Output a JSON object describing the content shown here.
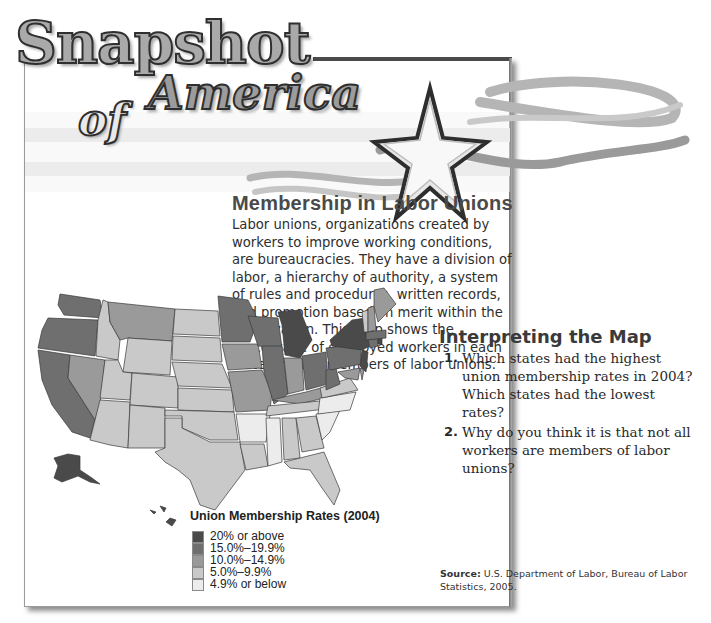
{
  "banner": {
    "title_line1": "Snapshot",
    "title_of": "of",
    "title_line2": "America",
    "decoration": "star-icon"
  },
  "article": {
    "heading": "Membership in Labor Unions",
    "intro": "Labor unions, organizations created by workers to improve working conditions, are bureaucracies. They have a division of labor, a hierarchy of authority, a system of rules and procedures, written records, and promotion based on merit within the organization. This map shows the percentage of employed workers in each state who are members of labor unions."
  },
  "interpreting": {
    "title": "Interpreting the Map",
    "questions": [
      {
        "num": "1.",
        "text": "Which states had the highest union membership rates in 2004? Which states had the lowest rates?"
      },
      {
        "num": "2.",
        "text": "Why do you think it is that not all workers are members of labor unions?"
      }
    ]
  },
  "legend": {
    "title": "Union Membership Rates (2004)",
    "items": [
      {
        "label": "20% or above",
        "color": "#4a4a4a"
      },
      {
        "label": "15.0%–19.9%",
        "color": "#6f6f6f"
      },
      {
        "label": "10.0%–14.9%",
        "color": "#9a9a9a"
      },
      {
        "label": "5.0%–9.9%",
        "color": "#c9c9c9"
      },
      {
        "label": "4.9% or below",
        "color": "#ececec"
      }
    ]
  },
  "source": {
    "label": "Source:",
    "text": "U.S. Department of Labor, Bureau of Labor Statistics, 2005."
  },
  "map": {
    "states": {
      "WA": 1,
      "OR": 1,
      "CA": 1,
      "NV": 2,
      "ID": 3,
      "MT": 2,
      "WY": 3,
      "UT": 3,
      "AZ": 3,
      "CO": 3,
      "NM": 3,
      "ND": 3,
      "SD": 3,
      "NE": 3,
      "KS": 3,
      "OK": 3,
      "TX": 3,
      "MN": 1,
      "IA": 2,
      "MO": 2,
      "AR": 4,
      "LA": 3,
      "WI": 1,
      "IL": 1,
      "MI": 0,
      "IN": 2,
      "OH": 1,
      "KY": 2,
      "TN": 3,
      "MS": 4,
      "AL": 3,
      "GA": 3,
      "FL": 3,
      "SC": 4,
      "NC": 4,
      "VA": 3,
      "WV": 1,
      "PA": 1,
      "NY": 0,
      "NJ": 0,
      "MD": 2,
      "DE": 2,
      "CT": 1,
      "RI": 0,
      "MA": 1,
      "VT": 3,
      "NH": 2,
      "ME": 2,
      "AK": 0,
      "HI": 0
    }
  }
}
